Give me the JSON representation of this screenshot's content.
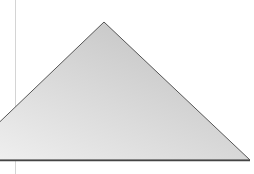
{
  "scene": {
    "background": "#ffffff",
    "guide_line": {
      "x": 15,
      "color": "#d4d4d4"
    },
    "triangle": {
      "points": "104,22 250,160 -40,160",
      "fill_light": "#f2f2f2",
      "fill_dark": "#bdbdbd",
      "stroke": "#555555"
    }
  }
}
